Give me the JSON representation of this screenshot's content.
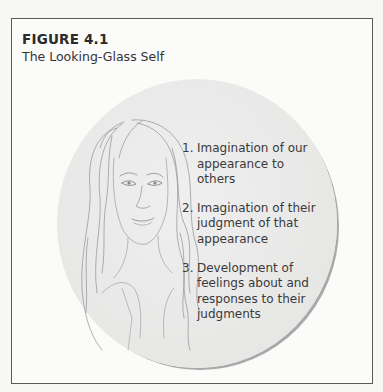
{
  "figure": {
    "label": "FIGURE 4.1",
    "title": "The Looking-Glass Self"
  },
  "illustration": {
    "subject": "pencil-sketch portrait of a woman with long wavy hair",
    "circle_color": "#e8e8e7",
    "circle_shadow": "#a9a9a9"
  },
  "steps": [
    {
      "number": "1.",
      "text": "Imagination of our appearance to others"
    },
    {
      "number": "2.",
      "text": "Imagination of their judgment of that appearance"
    },
    {
      "number": "3.",
      "text": "Development of feelings about and responses to their judgments"
    }
  ],
  "colors": {
    "frame_border": "#5a5a5a",
    "text": "#3a3a3a",
    "background": "#fbfbfa"
  }
}
